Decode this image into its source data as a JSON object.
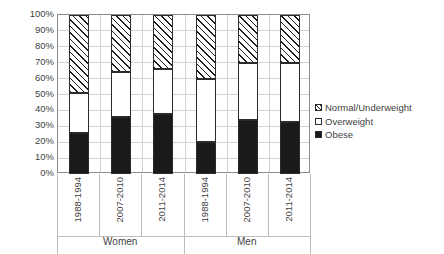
{
  "chart_data": {
    "type": "bar",
    "subtype": "stacked-100-percent",
    "title": "",
    "subtitle": "",
    "xlabel": "",
    "ylabel": "",
    "ylim": [
      0,
      100
    ],
    "y_tick_labels": [
      "100%",
      "90%",
      "80%",
      "70%",
      "60%",
      "50%",
      "40%",
      "30%",
      "20%",
      "10%",
      "0%"
    ],
    "y_tick_values": [
      100,
      90,
      80,
      70,
      60,
      50,
      40,
      30,
      20,
      10,
      0
    ],
    "grid": true,
    "legend_position": "right",
    "categories": [
      "1988-1994",
      "2007-2010",
      "2011-2014",
      "1988-1994",
      "2007-2010",
      "2011-2014"
    ],
    "groups": [
      {
        "label": "Women",
        "categories": [
          "1988-1994",
          "2007-2010",
          "2011-2014"
        ]
      },
      {
        "label": "Men",
        "categories": [
          "1988-1994",
          "2007-2010",
          "2011-2014"
        ]
      }
    ],
    "series": [
      {
        "name": "Obese",
        "fill": "solid-black",
        "color": "#1a1a1a",
        "values": [
          26,
          36,
          38,
          20,
          34,
          33
        ]
      },
      {
        "name": "Overweight",
        "fill": "white",
        "color": "#ffffff",
        "values": [
          25,
          28,
          28,
          40,
          36,
          37
        ]
      },
      {
        "name": "Normal/Underweight",
        "fill": "diagonal-hatch",
        "color": "#1a1a1a",
        "values": [
          49,
          36,
          34,
          40,
          30,
          30
        ]
      }
    ],
    "cumulative_tops": {
      "obese": [
        26,
        36,
        38,
        20,
        34,
        33
      ],
      "overweight": [
        51,
        64,
        66,
        60,
        70,
        70
      ],
      "normal_underweight": [
        100,
        100,
        100,
        100,
        100,
        100
      ]
    },
    "legend": [
      {
        "label": "Normal/Underweight",
        "swatch": "diagonal-hatch"
      },
      {
        "label": "Overweight",
        "swatch": "white"
      },
      {
        "label": "Obese",
        "swatch": "solid-black"
      }
    ]
  },
  "colors": {
    "plot_border": "#8c8c8c",
    "gridline": "#d3d3d3",
    "bar_outline": "#2b2b2b",
    "obese_fill": "#1a1a1a",
    "overweight_fill": "#ffffff",
    "text": "#3f3f3f",
    "background": "#ffffff"
  }
}
